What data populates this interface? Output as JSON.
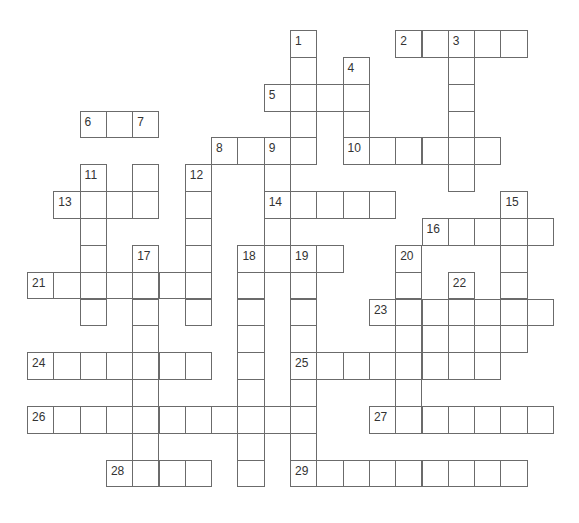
{
  "puzzle": {
    "type": "crossword",
    "grid": {
      "origin_x": 27,
      "origin_y": 30,
      "cell_w": 26.3,
      "cell_h": 26.85,
      "line_color": "#6b6b6b",
      "number_color": "#333333"
    },
    "clue_numbers": [
      1,
      2,
      3,
      4,
      5,
      6,
      7,
      8,
      9,
      10,
      11,
      12,
      13,
      14,
      15,
      16,
      17,
      18,
      19,
      20,
      21,
      22,
      23,
      24,
      25,
      26,
      27,
      28,
      29
    ],
    "entries": [
      {
        "num": 1,
        "dir": "down",
        "row": 0,
        "col": 10,
        "len": 5
      },
      {
        "num": 2,
        "dir": "across",
        "row": 0,
        "col": 14,
        "len": 5
      },
      {
        "num": 3,
        "dir": "down",
        "row": 0,
        "col": 16,
        "len": 6
      },
      {
        "num": 4,
        "dir": "down",
        "row": 1,
        "col": 12,
        "len": 4
      },
      {
        "num": 5,
        "dir": "across",
        "row": 2,
        "col": 9,
        "len": 4
      },
      {
        "num": 6,
        "dir": "across",
        "row": 3,
        "col": 2,
        "len": 3
      },
      {
        "num": 7,
        "dir": "down",
        "row": 3,
        "col": 4,
        "len": 4
      },
      {
        "num": 8,
        "dir": "across",
        "row": 4,
        "col": 7,
        "len": 4
      },
      {
        "num": 9,
        "dir": "down",
        "row": 4,
        "col": 9,
        "len": 5
      },
      {
        "num": 10,
        "dir": "across",
        "row": 4,
        "col": 12,
        "len": 6
      },
      {
        "num": 11,
        "dir": "down",
        "row": 5,
        "col": 2,
        "len": 6
      },
      {
        "num": 12,
        "dir": "down",
        "row": 5,
        "col": 6,
        "len": 6
      },
      {
        "num": 13,
        "dir": "across",
        "row": 6,
        "col": 1,
        "len": 4
      },
      {
        "num": 14,
        "dir": "across",
        "row": 6,
        "col": 9,
        "len": 5
      },
      {
        "num": 15,
        "dir": "down",
        "row": 6,
        "col": 18,
        "len": 6
      },
      {
        "num": 16,
        "dir": "across",
        "row": 7,
        "col": 15,
        "len": 5
      },
      {
        "num": 17,
        "dir": "down",
        "row": 8,
        "col": 4,
        "len": 9
      },
      {
        "num": 18,
        "dir": "across",
        "row": 8,
        "col": 8,
        "len": 4
      },
      {
        "num": 18,
        "dir": "down",
        "row": 8,
        "col": 8,
        "len": 9
      },
      {
        "num": 19,
        "dir": "down",
        "row": 8,
        "col": 10,
        "len": 9
      },
      {
        "num": 20,
        "dir": "down",
        "row": 8,
        "col": 14,
        "len": 7
      },
      {
        "num": 21,
        "dir": "across",
        "row": 9,
        "col": 0,
        "len": 7
      },
      {
        "num": 22,
        "dir": "down",
        "row": 9,
        "col": 16,
        "len": 4
      },
      {
        "num": 23,
        "dir": "across",
        "row": 10,
        "col": 13,
        "len": 7
      },
      {
        "num": 24,
        "dir": "across",
        "row": 12,
        "col": 0,
        "len": 7
      },
      {
        "num": 25,
        "dir": "across",
        "row": 12,
        "col": 10,
        "len": 8
      },
      {
        "num": 26,
        "dir": "across",
        "row": 14,
        "col": 0,
        "len": 11
      },
      {
        "num": 27,
        "dir": "across",
        "row": 14,
        "col": 13,
        "len": 7
      },
      {
        "num": 28,
        "dir": "across",
        "row": 16,
        "col": 3,
        "len": 4
      },
      {
        "num": 29,
        "dir": "across",
        "row": 16,
        "col": 10,
        "len": 9
      }
    ],
    "cells": [
      [
        0,
        10,
        "1"
      ],
      [
        0,
        14,
        "2"
      ],
      [
        0,
        15,
        ""
      ],
      [
        0,
        16,
        "3"
      ],
      [
        0,
        17,
        ""
      ],
      [
        0,
        18,
        ""
      ],
      [
        1,
        10,
        ""
      ],
      [
        1,
        12,
        "4"
      ],
      [
        1,
        16,
        ""
      ],
      [
        2,
        9,
        "5"
      ],
      [
        2,
        10,
        ""
      ],
      [
        2,
        11,
        ""
      ],
      [
        2,
        12,
        ""
      ],
      [
        2,
        16,
        ""
      ],
      [
        3,
        2,
        "6"
      ],
      [
        3,
        3,
        ""
      ],
      [
        3,
        4,
        "7"
      ],
      [
        3,
        10,
        ""
      ],
      [
        3,
        12,
        ""
      ],
      [
        3,
        16,
        ""
      ],
      [
        4,
        7,
        "8"
      ],
      [
        4,
        8,
        ""
      ],
      [
        4,
        9,
        "9"
      ],
      [
        4,
        10,
        ""
      ],
      [
        4,
        12,
        "10"
      ],
      [
        4,
        13,
        ""
      ],
      [
        4,
        14,
        ""
      ],
      [
        4,
        15,
        ""
      ],
      [
        4,
        16,
        ""
      ],
      [
        4,
        17,
        ""
      ],
      [
        5,
        2,
        "11"
      ],
      [
        5,
        4,
        ""
      ],
      [
        5,
        6,
        "12"
      ],
      [
        5,
        9,
        ""
      ],
      [
        5,
        16,
        ""
      ],
      [
        6,
        1,
        "13"
      ],
      [
        6,
        2,
        ""
      ],
      [
        6,
        3,
        ""
      ],
      [
        6,
        4,
        ""
      ],
      [
        6,
        6,
        ""
      ],
      [
        6,
        9,
        "14"
      ],
      [
        6,
        10,
        ""
      ],
      [
        6,
        11,
        ""
      ],
      [
        6,
        12,
        ""
      ],
      [
        6,
        13,
        ""
      ],
      [
        6,
        18,
        "15"
      ],
      [
        7,
        2,
        ""
      ],
      [
        7,
        6,
        ""
      ],
      [
        7,
        9,
        ""
      ],
      [
        7,
        15,
        "16"
      ],
      [
        7,
        16,
        ""
      ],
      [
        7,
        17,
        ""
      ],
      [
        7,
        18,
        ""
      ],
      [
        7,
        19,
        ""
      ],
      [
        8,
        2,
        ""
      ],
      [
        8,
        4,
        "17"
      ],
      [
        8,
        6,
        ""
      ],
      [
        8,
        8,
        "18"
      ],
      [
        8,
        9,
        ""
      ],
      [
        8,
        10,
        "19"
      ],
      [
        8,
        11,
        ""
      ],
      [
        8,
        14,
        "20"
      ],
      [
        8,
        18,
        ""
      ],
      [
        9,
        0,
        "21"
      ],
      [
        9,
        1,
        ""
      ],
      [
        9,
        2,
        ""
      ],
      [
        9,
        3,
        ""
      ],
      [
        9,
        4,
        ""
      ],
      [
        9,
        5,
        ""
      ],
      [
        9,
        6,
        ""
      ],
      [
        9,
        8,
        ""
      ],
      [
        9,
        10,
        ""
      ],
      [
        9,
        14,
        ""
      ],
      [
        9,
        16,
        "22"
      ],
      [
        9,
        18,
        ""
      ],
      [
        10,
        2,
        ""
      ],
      [
        10,
        4,
        ""
      ],
      [
        10,
        6,
        ""
      ],
      [
        10,
        8,
        ""
      ],
      [
        10,
        10,
        ""
      ],
      [
        10,
        13,
        "23"
      ],
      [
        10,
        14,
        ""
      ],
      [
        10,
        15,
        ""
      ],
      [
        10,
        16,
        ""
      ],
      [
        10,
        17,
        ""
      ],
      [
        10,
        18,
        ""
      ],
      [
        10,
        19,
        ""
      ],
      [
        11,
        4,
        ""
      ],
      [
        11,
        8,
        ""
      ],
      [
        11,
        10,
        ""
      ],
      [
        11,
        14,
        ""
      ],
      [
        11,
        15,
        ""
      ],
      [
        11,
        16,
        ""
      ],
      [
        11,
        17,
        ""
      ],
      [
        11,
        18,
        ""
      ],
      [
        12,
        0,
        "24"
      ],
      [
        12,
        1,
        ""
      ],
      [
        12,
        2,
        ""
      ],
      [
        12,
        3,
        ""
      ],
      [
        12,
        4,
        ""
      ],
      [
        12,
        5,
        ""
      ],
      [
        12,
        6,
        ""
      ],
      [
        12,
        8,
        ""
      ],
      [
        12,
        10,
        "25"
      ],
      [
        12,
        11,
        ""
      ],
      [
        12,
        12,
        ""
      ],
      [
        12,
        13,
        ""
      ],
      [
        12,
        14,
        ""
      ],
      [
        12,
        15,
        ""
      ],
      [
        12,
        16,
        ""
      ],
      [
        12,
        17,
        ""
      ],
      [
        13,
        4,
        ""
      ],
      [
        13,
        8,
        ""
      ],
      [
        13,
        10,
        ""
      ],
      [
        13,
        14,
        ""
      ],
      [
        14,
        0,
        "26"
      ],
      [
        14,
        1,
        ""
      ],
      [
        14,
        2,
        ""
      ],
      [
        14,
        3,
        ""
      ],
      [
        14,
        4,
        ""
      ],
      [
        14,
        5,
        ""
      ],
      [
        14,
        6,
        ""
      ],
      [
        14,
        7,
        ""
      ],
      [
        14,
        8,
        ""
      ],
      [
        14,
        9,
        ""
      ],
      [
        14,
        10,
        ""
      ],
      [
        14,
        13,
        "27"
      ],
      [
        14,
        14,
        ""
      ],
      [
        14,
        15,
        ""
      ],
      [
        14,
        16,
        ""
      ],
      [
        14,
        17,
        ""
      ],
      [
        14,
        18,
        ""
      ],
      [
        14,
        19,
        ""
      ],
      [
        15,
        4,
        ""
      ],
      [
        15,
        8,
        ""
      ],
      [
        15,
        10,
        ""
      ],
      [
        16,
        3,
        "28"
      ],
      [
        16,
        4,
        ""
      ],
      [
        16,
        5,
        ""
      ],
      [
        16,
        6,
        ""
      ],
      [
        16,
        8,
        ""
      ],
      [
        16,
        10,
        "29"
      ],
      [
        16,
        11,
        ""
      ],
      [
        16,
        12,
        ""
      ],
      [
        16,
        13,
        ""
      ],
      [
        16,
        14,
        ""
      ],
      [
        16,
        15,
        ""
      ],
      [
        16,
        16,
        ""
      ],
      [
        16,
        17,
        ""
      ],
      [
        16,
        18,
        ""
      ]
    ]
  }
}
